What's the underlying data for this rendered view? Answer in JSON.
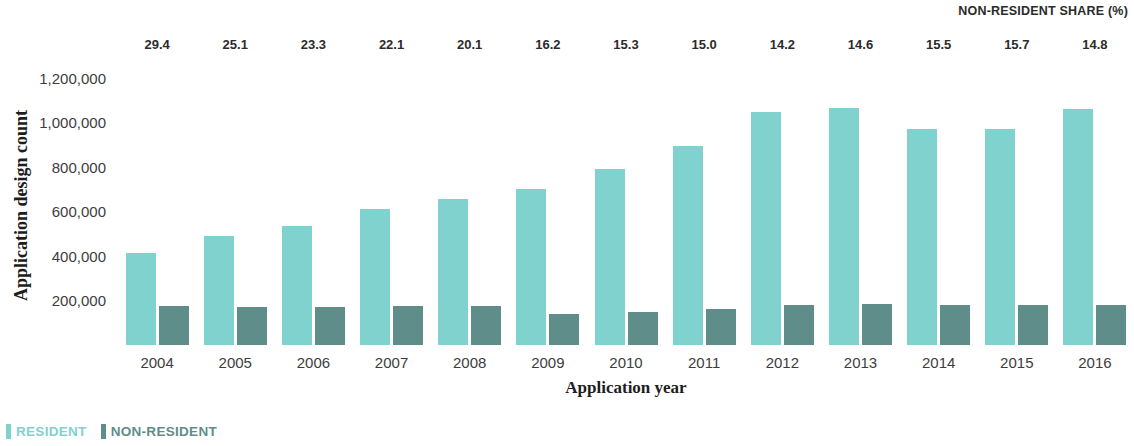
{
  "chart_data": {
    "type": "bar",
    "title": "",
    "xlabel": "Application year",
    "ylabel": "Application design count",
    "categories": [
      "2004",
      "2005",
      "2006",
      "2007",
      "2008",
      "2009",
      "2010",
      "2011",
      "2012",
      "2013",
      "2014",
      "2015",
      "2016"
    ],
    "series": [
      {
        "name": "RESIDENT",
        "color": "#7fd2ce",
        "values": [
          415000,
          490000,
          535000,
          610000,
          655000,
          700000,
          790000,
          895000,
          1045000,
          1065000,
          970000,
          970000,
          1060000
        ]
      },
      {
        "name": "NON-RESIDENT",
        "color": "#5f8d8a",
        "values": [
          175000,
          170000,
          170000,
          175000,
          175000,
          140000,
          148000,
          162000,
          178000,
          182000,
          178000,
          180000,
          180000
        ]
      }
    ],
    "annotation_row": {
      "header": "NON-RESIDENT SHARE (%)",
      "values": [
        "29.4",
        "25.1",
        "23.3",
        "22.1",
        "20.1",
        "16.2",
        "15.3",
        "15.0",
        "14.2",
        "14.6",
        "15.5",
        "15.7",
        "14.8"
      ]
    },
    "ylim": [
      0,
      1270000
    ],
    "yticks": [
      200000,
      400000,
      600000,
      800000,
      1000000,
      1200000
    ],
    "ytick_labels": [
      "200,000",
      "400,000",
      "600,000",
      "800,000",
      "1,000,000",
      "1,200,000"
    ],
    "grid": false,
    "legend_position": "bottom-left"
  },
  "legend": {
    "items": [
      {
        "label": "RESIDENT",
        "color": "#7fd2ce"
      },
      {
        "label": "NON-RESIDENT",
        "color": "#5f8d8a"
      }
    ]
  }
}
